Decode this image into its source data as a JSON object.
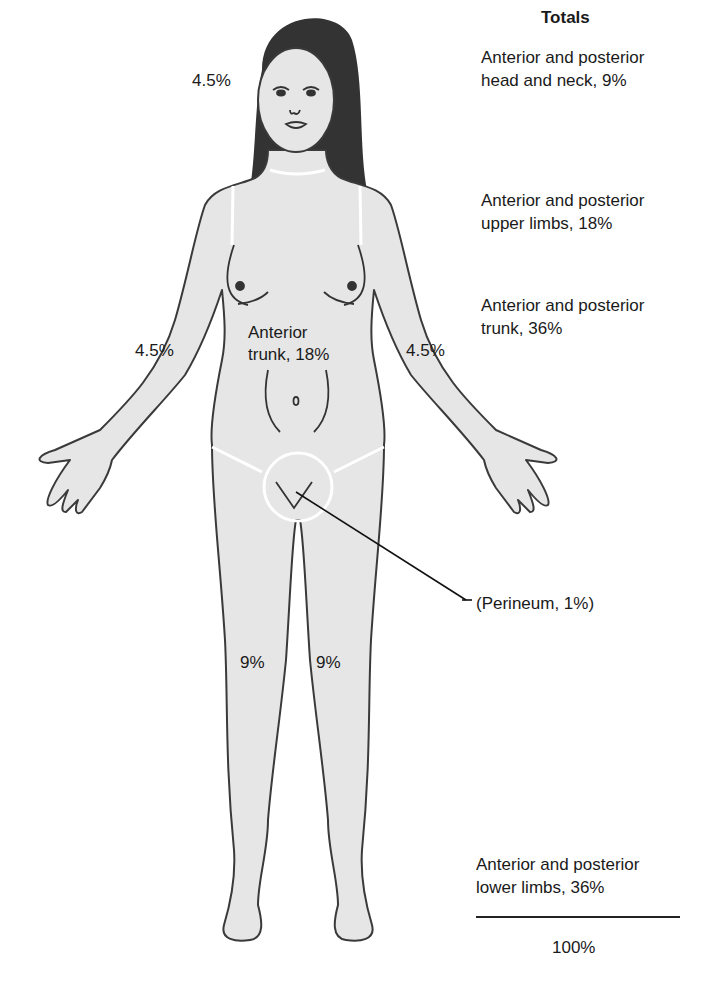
{
  "figure": {
    "colors": {
      "skin": "#e6e6e6",
      "outline": "#3a3a3a",
      "hair": "#333333",
      "region_divider": "#ffffff"
    }
  },
  "body_labels": {
    "head": "4.5%",
    "right_arm": "4.5%",
    "left_arm": "4.5%",
    "trunk_line1": "Anterior",
    "trunk_line2": "trunk, 18%",
    "perineum": "(Perineum, 1%)",
    "right_leg": "9%",
    "left_leg": "9%"
  },
  "totals": {
    "title": "Totals",
    "items": [
      {
        "line1": "Anterior and posterior",
        "line2": "head and neck, 9%"
      },
      {
        "line1": "Anterior and posterior",
        "line2": "upper limbs, 18%"
      },
      {
        "line1": "Anterior and posterior",
        "line2": "trunk, 36%"
      },
      {
        "line1": "Anterior and posterior",
        "line2": "lower limbs, 36%"
      }
    ],
    "sum": "100%"
  }
}
